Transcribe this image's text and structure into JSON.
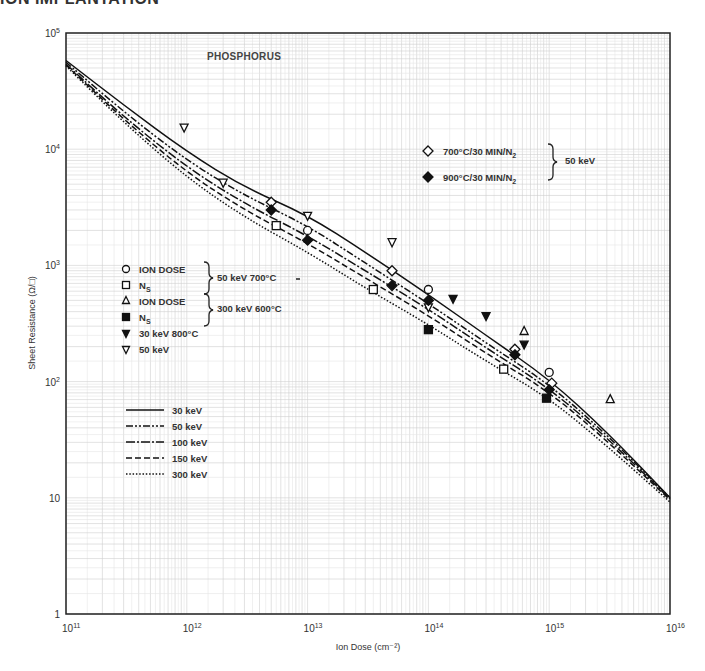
{
  "page": {
    "header_fragment": "ION IMPLANTATION"
  },
  "chart_data": {
    "type": "line",
    "title": "PHOSPHORUS",
    "xlabel": "Ion Dose (cm⁻²)",
    "ylabel": "Sheet Resistance (Ω/□)",
    "xscale": "log",
    "yscale": "log",
    "xlim": [
      100000000000.0,
      1e+16
    ],
    "ylim": [
      1,
      100000.0
    ],
    "grid": true,
    "x_ticks": [
      {
        "base": "10",
        "exp": "11"
      },
      {
        "base": "10",
        "exp": "12"
      },
      {
        "base": "10",
        "exp": "13"
      },
      {
        "base": "10",
        "exp": "14"
      },
      {
        "base": "10",
        "exp": "15"
      },
      {
        "base": "10",
        "exp": "16"
      }
    ],
    "y_ticks": [
      {
        "base": "1",
        "exp": ""
      },
      {
        "base": "10",
        "exp": ""
      },
      {
        "base": "10",
        "exp": "2"
      },
      {
        "base": "10",
        "exp": "3"
      },
      {
        "base": "10",
        "exp": "4"
      },
      {
        "base": "10",
        "exp": "5"
      }
    ],
    "series": [
      {
        "name": "30 keV",
        "style": "solid",
        "x": [
          100000000000.0,
          300000000000.0,
          1000000000000.0,
          3000000000000.0,
          10000000000000.0,
          30000000000000.0,
          100000000000000.0,
          300000000000000.0,
          1000000000000000.0,
          3000000000000000.0,
          1e+16
        ],
        "y": [
          58000,
          24000,
          9500,
          4700,
          2700,
          1300,
          560,
          250,
          105,
          37,
          10
        ]
      },
      {
        "name": "50 keV",
        "style": "dash-dot-dot",
        "x": [
          100000000000.0,
          300000000000.0,
          1000000000000.0,
          3000000000000.0,
          10000000000000.0,
          30000000000000.0,
          100000000000000.0,
          300000000000000.0,
          1000000000000000.0,
          3000000000000000.0,
          1e+16
        ],
        "y": [
          56000,
          21000,
          8000,
          4000,
          2200,
          1050,
          470,
          215,
          95,
          35,
          10
        ]
      },
      {
        "name": "100 keV",
        "style": "dash-dot",
        "x": [
          100000000000.0,
          300000000000.0,
          1000000000000.0,
          3000000000000.0,
          10000000000000.0,
          30000000000000.0,
          100000000000000.0,
          300000000000000.0,
          1000000000000000.0,
          3000000000000000.0,
          1e+16
        ],
        "y": [
          54000,
          19000,
          7000,
          3400,
          1800,
          900,
          420,
          195,
          88,
          33,
          9.8
        ]
      },
      {
        "name": "150 keV",
        "style": "dashed",
        "x": [
          100000000000.0,
          300000000000.0,
          1000000000000.0,
          3000000000000.0,
          10000000000000.0,
          30000000000000.0,
          100000000000000.0,
          300000000000000.0,
          1000000000000000.0,
          3000000000000000.0,
          1e+16
        ],
        "y": [
          53000,
          18000,
          6300,
          3000,
          1550,
          780,
          370,
          175,
          82,
          31,
          9.6
        ]
      },
      {
        "name": "300 keV",
        "style": "dotted",
        "x": [
          100000000000.0,
          300000000000.0,
          1000000000000.0,
          3000000000000.0,
          10000000000000.0,
          30000000000000.0,
          100000000000000.0,
          300000000000000.0,
          1000000000000000.0,
          3000000000000000.0,
          1e+16
        ],
        "y": [
          52000,
          17000,
          5700,
          2600,
          1300,
          640,
          310,
          150,
          72,
          28,
          9.2
        ]
      }
    ],
    "markers": [
      {
        "legend": "ION DOSE (50 keV 700°C)",
        "symbol": "circle-open",
        "points": [
          [
            10000000000000.0,
            2000
          ],
          [
            100000000000000.0,
            620
          ],
          [
            1000000000000000.0,
            120
          ]
        ]
      },
      {
        "legend": "N_S (50 keV 700°C)",
        "symbol": "square-open",
        "points": [
          [
            5500000000000.0,
            2200
          ],
          [
            35000000000000.0,
            620
          ],
          [
            420000000000000.0,
            128
          ]
        ]
      },
      {
        "legend": "ION DOSE (300 keV 600°C)",
        "symbol": "triangle-up-open",
        "points": [
          [
            620000000000000.0,
            270
          ],
          [
            3200000000000000.0,
            70
          ]
        ]
      },
      {
        "legend": "N_S (300 keV 600°C)",
        "symbol": "square-filled",
        "points": [
          [
            100000000000000.0,
            280
          ],
          [
            950000000000000.0,
            72
          ]
        ]
      },
      {
        "legend": "30 keV 800°C",
        "symbol": "triangle-down-filled",
        "points": [
          [
            160000000000000.0,
            520
          ],
          [
            300000000000000.0,
            370
          ],
          [
            620000000000000.0,
            210
          ]
        ]
      },
      {
        "legend": "50 keV",
        "symbol": "triangle-down-open",
        "points": [
          [
            950000000000.0,
            15500
          ],
          [
            2000000000000.0,
            5200
          ],
          [
            10000000000000.0,
            2700
          ],
          [
            50000000000000.0,
            1600
          ],
          [
            100000000000000.0,
            440
          ]
        ]
      },
      {
        "legend": "700°C/30 MIN/N2 (50 keV)",
        "symbol": "diamond-open",
        "points": [
          [
            5000000000000.0,
            3500
          ],
          [
            50000000000000.0,
            900
          ],
          [
            520000000000000.0,
            190
          ],
          [
            1050000000000000.0,
            97
          ]
        ]
      },
      {
        "legend": "900°C/30 MIN/N2 (50 keV)",
        "symbol": "diamond-filled",
        "points": [
          [
            5000000000000.0,
            3000
          ],
          [
            10000000000000.0,
            1650
          ],
          [
            50000000000000.0,
            670
          ],
          [
            100000000000000.0,
            500
          ],
          [
            520000000000000.0,
            170
          ],
          [
            1000000000000000.0,
            85
          ]
        ]
      }
    ]
  },
  "legends": {
    "anneal": {
      "items": [
        {
          "symbol": "diamond-open",
          "label": "700°C/30 MIN/N",
          "sub": "2"
        },
        {
          "symbol": "diamond-filled",
          "label": "900°C/30 MIN/N",
          "sub": "2"
        }
      ],
      "group_label": "50 keV"
    },
    "markers": {
      "items": [
        {
          "symbol": "circle-open",
          "label": "ION DOSE",
          "sub": ""
        },
        {
          "symbol": "square-open",
          "label": "N",
          "sub": "S"
        },
        {
          "symbol": "triangle-up-open",
          "label": "ION DOSE",
          "sub": ""
        },
        {
          "symbol": "square-filled",
          "label": "N",
          "sub": "S"
        },
        {
          "symbol": "triangle-down-filled",
          "label": "30 keV 800°C",
          "sub": ""
        },
        {
          "symbol": "triangle-down-open",
          "label": "50 keV",
          "sub": ""
        }
      ],
      "group1_label": "50 keV 700°C",
      "group2_label": "300 keV 600°C"
    },
    "lines": {
      "items": [
        {
          "style": "solid",
          "label": "30 keV"
        },
        {
          "style": "dash-dot-dot",
          "label": "50 keV"
        },
        {
          "style": "dash-dot",
          "label": "100 keV"
        },
        {
          "style": "dashed",
          "label": "150 keV"
        },
        {
          "style": "dotted",
          "label": "300 keV"
        }
      ]
    }
  }
}
